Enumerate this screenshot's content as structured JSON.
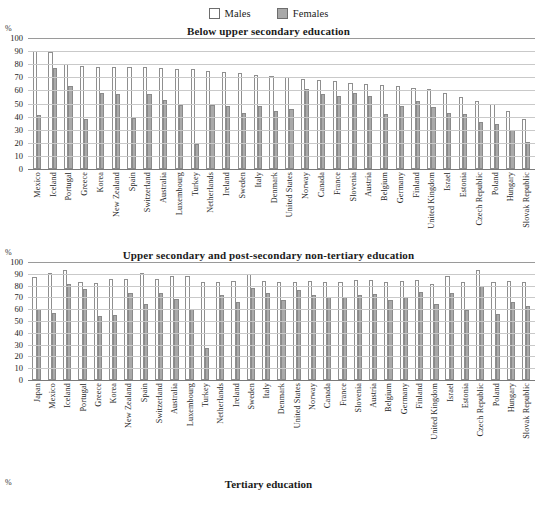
{
  "legend": {
    "items": [
      {
        "label": "Males",
        "color": "#ffffff",
        "key": "males"
      },
      {
        "label": "Females",
        "color": "#a8a8a8",
        "key": "females"
      }
    ]
  },
  "axis": {
    "unit_label": "%",
    "ticks": [
      "100",
      "90",
      "80",
      "70",
      "60",
      "50",
      "40",
      "30",
      "20",
      "10",
      "0"
    ]
  },
  "chart_data": [
    {
      "type": "bar",
      "title": "Below upper secondary education",
      "xlabel": "",
      "ylabel": "%",
      "ylim": [
        0,
        100
      ],
      "grid": true,
      "legend_position": "top-center",
      "categories": [
        "Mexico",
        "Iceland",
        "Portugal",
        "Greece",
        "Korea",
        "New Zealand",
        "Spain",
        "Switzerland",
        "Australia",
        "Luxembourg",
        "Turkey",
        "Netherlands",
        "Ireland",
        "Sweden",
        "Italy",
        "Denmark",
        "United States",
        "Norway",
        "Canada",
        "France",
        "Slovenia",
        "Austria",
        "Belgium",
        "Germany",
        "Finland",
        "United Kingdom",
        "Israel",
        "Estonia",
        "Czech Republic",
        "Poland",
        "Hungary",
        "Slovak Republic"
      ],
      "series": [
        {
          "name": "Males",
          "values": [
            90,
            89,
            80,
            79,
            78,
            78,
            78,
            78,
            77,
            76,
            76,
            75,
            74,
            73,
            72,
            71,
            70,
            69,
            68,
            67,
            66,
            65,
            64,
            63,
            62,
            61,
            58,
            55,
            52,
            50,
            44,
            38
          ]
        },
        {
          "name": "Females",
          "values": [
            41,
            77,
            63,
            38,
            58,
            57,
            39,
            57,
            53,
            49,
            19,
            49,
            48,
            43,
            48,
            44,
            46,
            61,
            57,
            56,
            58,
            56,
            42,
            48,
            52,
            47,
            43,
            42,
            36,
            34,
            30,
            21
          ]
        }
      ]
    },
    {
      "type": "bar",
      "title": "Upper secondary and post-secondary non-tertiary education",
      "xlabel": "",
      "ylabel": "%",
      "ylim": [
        0,
        100
      ],
      "grid": true,
      "legend_position": "top-center",
      "categories": [
        "Japan",
        "Mexico",
        "Iceland",
        "Portugal",
        "Greece",
        "Korea",
        "New Zealand",
        "Spain",
        "Switzerland",
        "Australia",
        "Luxembourg",
        "Turkey",
        "Netherlands",
        "Ireland",
        "Sweden",
        "Italy",
        "Denmark",
        "United States",
        "Norway",
        "Canada",
        "France",
        "Slovenia",
        "Austria",
        "Belgium",
        "Germany",
        "Finland",
        "United Kingdom",
        "Israel",
        "Estonia",
        "Czech Republic",
        "Poland",
        "Hungary",
        "Slovak Republic"
      ],
      "series": [
        {
          "name": "Males",
          "values": [
            87,
            91,
            93,
            83,
            82,
            86,
            86,
            91,
            86,
            88,
            88,
            83,
            83,
            84,
            90,
            84,
            83,
            83,
            84,
            83,
            83,
            85,
            85,
            83,
            84,
            85,
            81,
            88,
            83,
            93,
            83,
            84,
            83
          ]
        },
        {
          "name": "Females",
          "values": [
            60,
            57,
            81,
            77,
            54,
            55,
            74,
            64,
            74,
            69,
            60,
            27,
            72,
            66,
            78,
            74,
            68,
            76,
            72,
            70,
            70,
            72,
            73,
            68,
            70,
            75,
            64,
            74,
            59,
            80,
            56,
            66,
            63
          ]
        }
      ]
    },
    {
      "type": "bar",
      "title": "Tertiary education",
      "xlabel": "",
      "ylabel": "%",
      "ylim": [
        0,
        100
      ],
      "grid": true,
      "legend_position": "top-center",
      "categories": [],
      "series": []
    }
  ]
}
